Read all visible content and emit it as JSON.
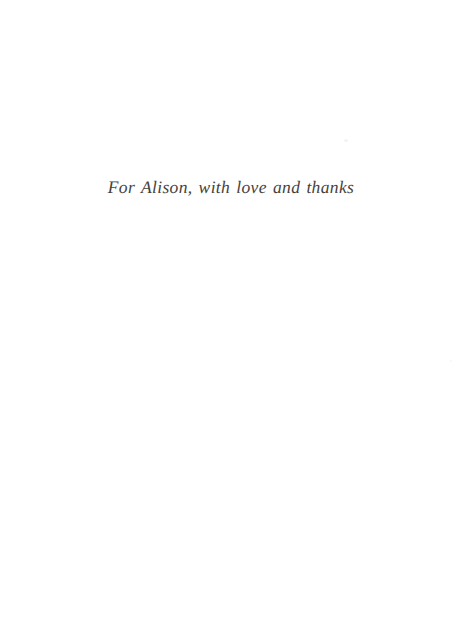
{
  "page": {
    "kind": "book-dedication-page",
    "background_color": "#ffffff",
    "width": 468,
    "height": 630
  },
  "dedication": {
    "text": "For Alison, with love and thanks",
    "color": "#37332f",
    "style": "italic"
  },
  "artifacts": {
    "speck_color": "#f2eeea"
  }
}
